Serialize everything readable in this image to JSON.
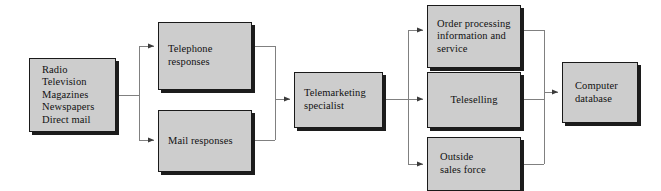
{
  "diagram": {
    "type": "flowchart",
    "colors": {
      "node_fill": "#cdcdcd",
      "node_border": "#1a1a1a",
      "node_shadow": "#1c1c1c",
      "connector": "#808080",
      "text": "#111111",
      "background": "#ffffff"
    }
  },
  "nodes": {
    "sources": {
      "id": "sources",
      "label": "Radio\nTelevision\nMagazines\nNewspapers\nDirect mail",
      "items": [
        "Radio",
        "Television",
        "Magazines",
        "Newspapers",
        "Direct mail"
      ],
      "x": 29,
      "y": 58,
      "w": 87,
      "h": 74
    },
    "telephone_responses": {
      "id": "telephone-responses",
      "label": "Telephone\nresponses",
      "x": 158,
      "y": 22,
      "w": 94,
      "h": 68
    },
    "mail_responses": {
      "id": "mail-responses",
      "label": "Mail responses",
      "x": 158,
      "y": 110,
      "w": 94,
      "h": 62
    },
    "telemarketing_specialist": {
      "id": "telemarketing-specialist",
      "label": "Telemarketing\nspecialist",
      "x": 294,
      "y": 72,
      "w": 89,
      "h": 56
    },
    "order_processing": {
      "id": "order-processing",
      "label": "Order processing\ninformation and\nservice",
      "x": 427,
      "y": 5,
      "w": 94,
      "h": 63
    },
    "teleselling": {
      "id": "teleselling",
      "label": "Teleselling",
      "x": 427,
      "y": 72,
      "w": 94,
      "h": 56
    },
    "outside_sales_force": {
      "id": "outside-sales-force",
      "label": "Outside\nsales force",
      "x": 427,
      "y": 137,
      "w": 94,
      "h": 54
    },
    "computer_database": {
      "id": "computer-database",
      "label": "Computer\ndatabase",
      "x": 562,
      "y": 62,
      "w": 76,
      "h": 61
    }
  },
  "connectors": [
    {
      "id": "sources-to-telephone",
      "from": "sources",
      "to": "telephone_responses",
      "arrow": true
    },
    {
      "id": "sources-to-mail",
      "from": "sources",
      "to": "mail_responses",
      "arrow": true
    },
    {
      "id": "telephone-to-specialist",
      "from": "telephone_responses",
      "to": "telemarketing_specialist",
      "arrow": true
    },
    {
      "id": "mail-to-specialist",
      "from": "mail_responses",
      "to": "telemarketing_specialist",
      "arrow": true
    },
    {
      "id": "specialist-to-order-processing",
      "from": "telemarketing_specialist",
      "to": "order_processing",
      "arrow": true
    },
    {
      "id": "specialist-to-teleselling",
      "from": "telemarketing_specialist",
      "to": "teleselling",
      "arrow": true
    },
    {
      "id": "specialist-to-outside-sales",
      "from": "telemarketing_specialist",
      "to": "outside_sales_force",
      "arrow": true
    },
    {
      "id": "order-processing-to-database",
      "from": "order_processing",
      "to": "computer_database",
      "arrow": true
    },
    {
      "id": "teleselling-to-database",
      "from": "teleselling",
      "to": "computer_database",
      "arrow": true
    },
    {
      "id": "outside-sales-to-database",
      "from": "outside_sales_force",
      "to": "computer_database",
      "arrow": true
    }
  ]
}
